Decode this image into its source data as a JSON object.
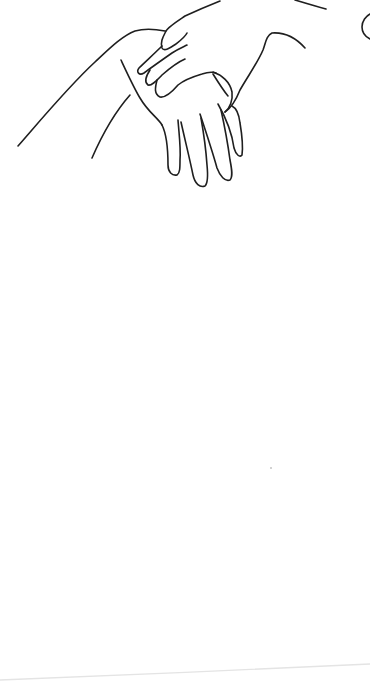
{
  "image": {
    "subject": "line drawing of two hands, one resting on top of the other",
    "width": 370,
    "height": 698,
    "background": "#ffffff",
    "ink_color": "#1f1f1f",
    "ink_width": 1.6,
    "paper_edge_color": "#e4e4e4"
  },
  "strokes": [
    {
      "name": "left-arm-outer-contour",
      "d": "M18 146 C45 115 70 85 95 62 C110 48 122 36 135 31 C145 28 155 29 165 31"
    },
    {
      "name": "left-arm-inner-contour",
      "d": "M92 158 C102 135 115 112 130 95"
    },
    {
      "name": "lower-hand-wrist-edge",
      "d": "M121 60 C128 75 134 88 140 98 C148 112 158 118 162 125"
    },
    {
      "name": "lower-hand-index-finger",
      "d": "M162 125 C167 135 168 150 168 165 C168 172 172 176 177 175 C180 173 180 168 180 160 C181 148 179 134 178 120"
    },
    {
      "name": "lower-hand-middle-finger",
      "d": "M181 122 C185 140 190 160 193 175 C195 184 200 188 205 186 C208 183 208 175 207 165 C206 150 204 135 201 118"
    },
    {
      "name": "lower-hand-ring-finger",
      "d": "M200 114 C206 132 212 150 217 168 C220 176 225 182 230 180 C233 177 232 170 230 160 C228 145 225 128 221 110"
    },
    {
      "name": "lower-hand-pinky-finger",
      "d": "M218 104 C226 118 232 133 234 148 C236 155 240 158 242 155 C243 148 242 135 240 123 C239 114 236 108 232 106"
    },
    {
      "name": "lower-hand-thumb-edge",
      "d": "M213 72 C222 75 230 82 232 92 C233 100 230 108 225 112"
    },
    {
      "name": "lower-hand-wrist-crease",
      "d": "M213 74 C218 82 223 90 228 96"
    },
    {
      "name": "upper-hand-back-contour",
      "d": "M166 31 C168 27 176 22 185 16 C198 10 210 5 220 1"
    },
    {
      "name": "upper-hand-index-finger",
      "d": "M166 31 C163 37 160 42 162 48 C164 52 170 48 176 44 C181 40 185 37 187 33"
    },
    {
      "name": "upper-hand-middle-finger",
      "d": "M162 46 C154 54 145 62 139 68 C136 72 139 76 144 73 C152 67 162 60 172 53 C178 49 183 47 187 45"
    },
    {
      "name": "upper-hand-ring-finger",
      "d": "M150 70 C146 76 144 82 148 85 C152 86 157 80 162 75 C170 68 178 62 185 59"
    },
    {
      "name": "upper-hand-pinky-finger",
      "d": "M157 80 C155 88 154 94 160 97 C166 98 172 92 178 85 C184 80 192 77 202 74 C208 72 213 72 216 73"
    },
    {
      "name": "upper-hand-thumb-and-wrist",
      "d": "M225 112 C231 108 236 100 240 90 C248 76 258 62 263 50 C266 42 266 36 272 33 C285 32 296 38 305 48"
    },
    {
      "name": "upper-forearm-top-edge",
      "d": "M295 0 C305 3 315 6 326 9"
    },
    {
      "name": "right-edge-partial-shape",
      "d": "M370 14 C366 16 362 21 362 27 C362 33 366 37 370 39"
    }
  ],
  "marks": [
    {
      "name": "stray-speck",
      "x": 271,
      "y": 468,
      "r": 0.8,
      "color": "#9a9a9a"
    }
  ],
  "paper_edge": {
    "d": "M0 680 C120 675 250 670 370 664"
  }
}
